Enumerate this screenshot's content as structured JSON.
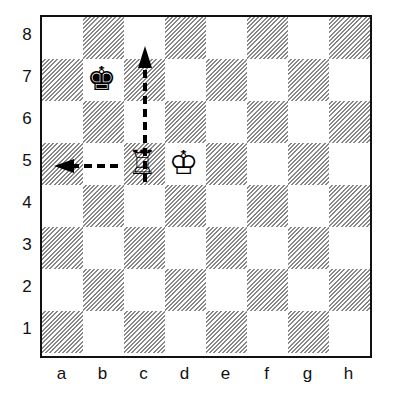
{
  "diagram": {
    "ranks": [
      "8",
      "7",
      "6",
      "5",
      "4",
      "3",
      "2",
      "1"
    ],
    "files": [
      "a",
      "b",
      "c",
      "d",
      "e",
      "f",
      "g",
      "h"
    ],
    "pieces": [
      {
        "square": "b7",
        "piece": "black-king",
        "glyph": "♚"
      },
      {
        "square": "c5",
        "piece": "white-rook",
        "glyph": "♖"
      },
      {
        "square": "d5",
        "piece": "white-king",
        "glyph": "♔"
      }
    ],
    "arrows": [
      {
        "from": "c5",
        "to": "c8",
        "style": "dashed"
      },
      {
        "from": "c5",
        "to": "a5",
        "style": "dashed"
      }
    ]
  }
}
